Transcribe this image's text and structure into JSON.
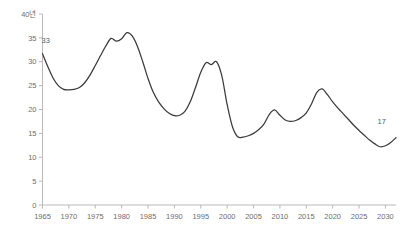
{
  "chart_data": {
    "type": "line",
    "title": "",
    "xlabel": "",
    "ylabel": "",
    "y_unit_label": "40년",
    "xlim": [
      1965,
      2032
    ],
    "ylim": [
      0,
      40
    ],
    "grid": false,
    "legend": null,
    "y_ticks": [
      0,
      5,
      10,
      15,
      20,
      25,
      30,
      35,
      40
    ],
    "y_tick_labels": [
      "0",
      "5",
      "10",
      "15",
      "20",
      "25",
      "30",
      "35",
      "40"
    ],
    "x_ticks": [
      1965,
      1970,
      1975,
      1980,
      1985,
      1990,
      1995,
      2000,
      2005,
      2010,
      2015,
      2020,
      2025,
      2030
    ],
    "x_tick_labels": [
      "1965",
      "1970",
      "1975",
      "1980",
      "1985",
      "1990",
      "1995",
      "2000",
      "2005",
      "2010",
      "2015",
      "2020",
      "2025",
      "2030"
    ],
    "series": [
      {
        "name": "series-1",
        "color": "#3a3a3a",
        "x": [
          1965,
          1966,
          1967,
          1968,
          1969,
          1970,
          1971,
          1972,
          1973,
          1974,
          1975,
          1976,
          1977,
          1978,
          1979,
          1980,
          1981,
          1982,
          1983,
          1984,
          1985,
          1986,
          1987,
          1988,
          1989,
          1990,
          1991,
          1992,
          1993,
          1994,
          1995,
          1996,
          1997,
          1998,
          1999,
          2000,
          2001,
          2002,
          2003,
          2004,
          2005,
          2006,
          2007,
          2008,
          2009,
          2010,
          2011,
          2012,
          2013,
          2014,
          2015,
          2016,
          2017,
          2018,
          2019,
          2020,
          2021,
          2022,
          2023,
          2024,
          2025,
          2026,
          2027,
          2028,
          2029,
          2030,
          2031,
          2032
        ],
        "y": [
          31.7,
          29.0,
          26.6,
          25.0,
          24.2,
          24.1,
          24.2,
          24.6,
          25.6,
          27.2,
          29.2,
          31.3,
          33.3,
          34.9,
          34.3,
          34.8,
          36.1,
          35.4,
          33.2,
          30.0,
          26.5,
          23.6,
          21.6,
          20.2,
          19.2,
          18.7,
          18.8,
          19.6,
          21.6,
          24.6,
          27.8,
          29.8,
          29.4,
          30.0,
          27.0,
          21.0,
          16.4,
          14.3,
          14.2,
          14.5,
          15.0,
          15.8,
          17.0,
          19.0,
          19.9,
          18.8,
          17.8,
          17.5,
          17.7,
          18.3,
          19.3,
          21.2,
          23.6,
          24.3,
          23.1,
          21.6,
          20.3,
          19.1,
          17.9,
          16.7,
          15.6,
          14.6,
          13.6,
          12.8,
          12.2,
          12.4,
          13.1,
          14.1
        ]
      }
    ],
    "annotations": [
      {
        "text": "33",
        "x": 1965.6,
        "y": 33.9,
        "name": "start-value-label"
      },
      {
        "text": "17",
        "x": 2029.3,
        "y": 17.0,
        "name": "end-value-label"
      }
    ]
  }
}
